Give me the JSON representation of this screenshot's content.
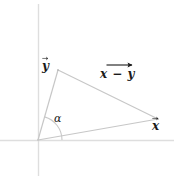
{
  "figure": {
    "kind": "vector-subtraction-diagram",
    "background_color": "#ffffff",
    "axis_color": "#d9d9d9",
    "vector_line_color": "#c9c9c9",
    "arc_color": "#c9c9c9",
    "text_color": "#1a1a1a",
    "width": 174,
    "height": 180
  },
  "axes": {
    "origin": {
      "x": 38,
      "y": 140
    },
    "horizontal": {
      "x1": 0,
      "y1": 140,
      "x2": 174,
      "y2": 140
    },
    "vertical": {
      "x1": 38,
      "y1": 4,
      "x2": 38,
      "y2": 175
    }
  },
  "points": {
    "origin": {
      "x": 38,
      "y": 140
    },
    "y_tip": {
      "x": 58,
      "y": 70
    },
    "x_tip": {
      "x": 158,
      "y": 119
    }
  },
  "labels": {
    "vector_y": {
      "base": "y",
      "accent": "arrow",
      "text": "y⃗"
    },
    "vector_x": {
      "base": "x",
      "accent": "arrow",
      "text": "x⃗"
    },
    "difference": {
      "text": "x − y",
      "accent": "arrow"
    },
    "angle": {
      "text": "α"
    }
  },
  "angle_arc": {
    "center": {
      "x": 38,
      "y": 140
    },
    "radius": 24,
    "from_degrees": 0,
    "to_degrees": 74
  },
  "icons": {
    "vector-arrow-icon": "⃗",
    "minus-sign-icon": "−"
  }
}
